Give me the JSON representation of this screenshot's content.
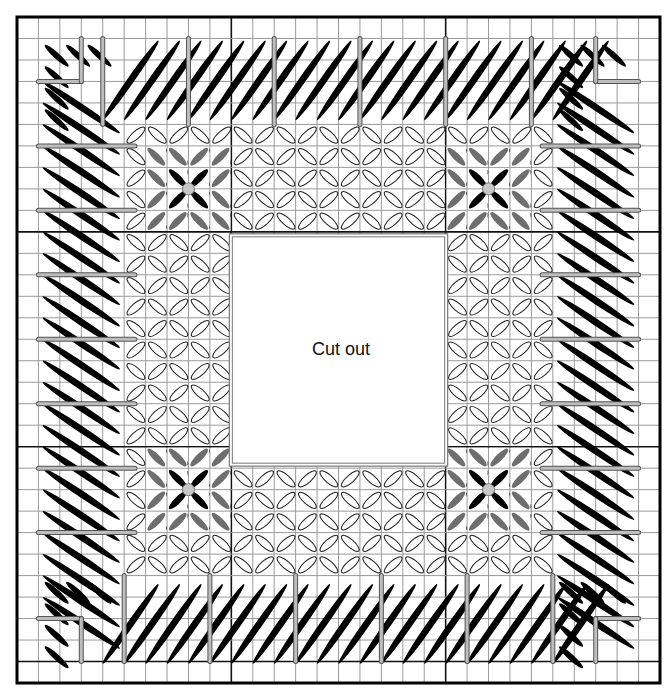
{
  "cutout": {
    "label": "Cut out"
  },
  "grid": {
    "left": 17,
    "top": 17,
    "right": 660,
    "bottom": 683,
    "cols": 30,
    "rows": 31,
    "major_every": 10,
    "minor_color": "#9a9a9a",
    "major_color": "#111111",
    "frame_color": "#000000"
  },
  "cutout_box": {
    "col0": 10,
    "row0": 10,
    "col1": 20,
    "row1": 21
  },
  "colors": {
    "dark_stitch": "#000000",
    "medium_stitch": "#6e6e6e",
    "light_stitch": "#ffffff",
    "light_stitch_outline": "#222222",
    "divider_bar": "#bdbdbd",
    "center_dot": "#c8c8c8"
  },
  "legend": {
    "stitch_types": [
      {
        "name": "outer-border-slanted-stitch",
        "color": "black"
      },
      {
        "name": "inner-field-stitch",
        "color": "white"
      },
      {
        "name": "corner-motif-stitch",
        "color": "gray"
      },
      {
        "name": "corner-motif-center",
        "color": "light gray dot"
      }
    ]
  },
  "corner_motifs": [
    {
      "position": "top-left",
      "col": 8,
      "row": 8
    },
    {
      "position": "top-right",
      "col": 22,
      "row": 8
    },
    {
      "position": "bottom-left",
      "col": 8,
      "row": 22
    },
    {
      "position": "bottom-right",
      "col": 22,
      "row": 22
    }
  ]
}
